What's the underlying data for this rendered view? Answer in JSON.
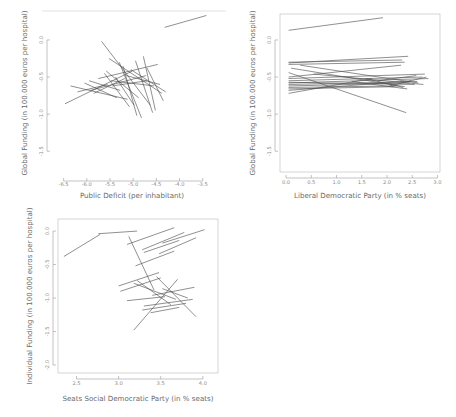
{
  "figure": {
    "title": "",
    "background": "#ffffff",
    "line_color": "#4a4a4a",
    "axis_color": "#9a9a9a",
    "panel_count": 3
  },
  "chart_data": [
    {
      "id": "panel-1",
      "type": "line",
      "title": "",
      "xlabel": "Public Deficit (per inhabitant)",
      "ylabel": "Global Funding (in 100.000 euros per hospital)",
      "xlim": [
        -6.75,
        -3.3
      ],
      "ylim": [
        -1.78,
        0.35
      ],
      "xticks": [
        -6.5,
        -6.0,
        -5.5,
        -5.0,
        -4.5,
        -4.0,
        -3.5
      ],
      "xticklabels": [
        "-6.5",
        "-6.0",
        "-5.5",
        "-5.0",
        "-4.5",
        "-4.0",
        "-3.5"
      ],
      "yticks": [
        0.0,
        -0.5,
        -1.0,
        -1.5
      ],
      "yticklabels": [
        "0.0",
        "-0.5",
        "-1.0",
        "-1.5"
      ],
      "grid": false,
      "legend": "none",
      "series": [
        {
          "name": "slope-01",
          "x": [
            -4.32,
            -3.42
          ],
          "y": [
            0.17,
            0.33
          ]
        },
        {
          "name": "slope-02",
          "x": [
            -5.68,
            -4.63
          ],
          "y": [
            -0.02,
            -0.88
          ]
        },
        {
          "name": "slope-03",
          "x": [
            -5.75,
            -4.47
          ],
          "y": [
            -0.52,
            -0.33
          ]
        },
        {
          "name": "slope-04",
          "x": [
            -5.52,
            -4.38
          ],
          "y": [
            -0.25,
            -0.72
          ]
        },
        {
          "name": "slope-05",
          "x": [
            -6.47,
            -5.02
          ],
          "y": [
            -0.86,
            -0.42
          ]
        },
        {
          "name": "slope-06",
          "x": [
            -6.35,
            -5.12
          ],
          "y": [
            -0.62,
            -0.8
          ]
        },
        {
          "name": "slope-07",
          "x": [
            -5.92,
            -4.72
          ],
          "y": [
            -0.68,
            -0.48
          ]
        },
        {
          "name": "slope-08",
          "x": [
            -5.48,
            -4.55
          ],
          "y": [
            -0.55,
            -0.62
          ]
        },
        {
          "name": "slope-09",
          "x": [
            -5.3,
            -4.82
          ],
          "y": [
            -0.3,
            -1.05
          ]
        },
        {
          "name": "slope-10",
          "x": [
            -5.22,
            -4.92
          ],
          "y": [
            -0.35,
            -1.02
          ]
        },
        {
          "name": "slope-11",
          "x": [
            -4.95,
            -4.58
          ],
          "y": [
            -0.28,
            -0.98
          ]
        },
        {
          "name": "slope-12",
          "x": [
            -5.62,
            -5.08
          ],
          "y": [
            -0.45,
            -0.9
          ]
        },
        {
          "name": "slope-13",
          "x": [
            -6.05,
            -5.35
          ],
          "y": [
            -0.58,
            -0.78
          ]
        },
        {
          "name": "slope-14",
          "x": [
            -5.05,
            -4.3
          ],
          "y": [
            -0.4,
            -0.7
          ]
        },
        {
          "name": "slope-15",
          "x": [
            -4.78,
            -4.52
          ],
          "y": [
            -0.22,
            -0.95
          ]
        },
        {
          "name": "slope-16",
          "x": [
            -5.85,
            -5.18
          ],
          "y": [
            -0.72,
            -0.52
          ]
        },
        {
          "name": "slope-17",
          "x": [
            -5.45,
            -4.7
          ],
          "y": [
            -0.62,
            -0.55
          ]
        },
        {
          "name": "slope-18",
          "x": [
            -6.2,
            -5.55
          ],
          "y": [
            -0.7,
            -0.6
          ]
        },
        {
          "name": "slope-19",
          "x": [
            -5.38,
            -4.98
          ],
          "y": [
            -0.5,
            -0.88
          ]
        },
        {
          "name": "slope-20",
          "x": [
            -5.15,
            -4.42
          ],
          "y": [
            -0.48,
            -0.6
          ]
        },
        {
          "name": "slope-21",
          "x": [
            -4.7,
            -4.35
          ],
          "y": [
            -0.38,
            -0.82
          ]
        },
        {
          "name": "slope-22",
          "x": [
            -5.95,
            -5.28
          ],
          "y": [
            -0.55,
            -0.68
          ]
        },
        {
          "name": "slope-23",
          "x": [
            -5.58,
            -4.88
          ],
          "y": [
            -0.42,
            -0.78
          ]
        }
      ]
    },
    {
      "id": "panel-2",
      "type": "line",
      "title": "",
      "xlabel": "Liberal Democratic Party (in % seats)",
      "ylabel": "Global Funding (in 100.000 euros per hospital)",
      "xlim": [
        -0.12,
        3.05
      ],
      "ylim": [
        -1.78,
        0.35
      ],
      "xticks": [
        0.0,
        0.5,
        1.0,
        1.5,
        2.0,
        2.5,
        3.0
      ],
      "xticklabels": [
        "0.0",
        "0.5",
        "1.0",
        "1.5",
        "2.0",
        "2.5",
        "3.0"
      ],
      "yticks": [
        0.0,
        -0.5,
        -1.0,
        -1.5
      ],
      "yticklabels": [
        "0.0",
        "-0.5",
        "-1.0",
        "-1.5"
      ],
      "grid": false,
      "legend": "none",
      "series": [
        {
          "name": "slope-01",
          "x": [
            0.05,
            1.92
          ],
          "y": [
            0.13,
            0.3
          ]
        },
        {
          "name": "slope-02",
          "x": [
            0.05,
            2.42
          ],
          "y": [
            -0.31,
            -0.22
          ]
        },
        {
          "name": "slope-03",
          "x": [
            0.05,
            2.35
          ],
          "y": [
            -0.33,
            -0.3
          ]
        },
        {
          "name": "slope-04",
          "x": [
            0.05,
            2.3
          ],
          "y": [
            -0.3,
            -0.27
          ]
        },
        {
          "name": "slope-05",
          "x": [
            0.05,
            2.38
          ],
          "y": [
            -0.44,
            -0.98
          ]
        },
        {
          "name": "slope-06",
          "x": [
            0.05,
            2.75
          ],
          "y": [
            -0.52,
            -0.46
          ]
        },
        {
          "name": "slope-07",
          "x": [
            0.05,
            2.7
          ],
          "y": [
            -0.55,
            -0.5
          ]
        },
        {
          "name": "slope-08",
          "x": [
            0.05,
            2.82
          ],
          "y": [
            -0.58,
            -0.52
          ]
        },
        {
          "name": "slope-09",
          "x": [
            0.05,
            2.6
          ],
          "y": [
            -0.6,
            -0.56
          ]
        },
        {
          "name": "slope-10",
          "x": [
            0.05,
            2.45
          ],
          "y": [
            -0.62,
            -0.58
          ]
        },
        {
          "name": "slope-11",
          "x": [
            0.05,
            2.55
          ],
          "y": [
            -0.57,
            -0.6
          ]
        },
        {
          "name": "slope-12",
          "x": [
            0.05,
            2.2
          ],
          "y": [
            -0.64,
            -0.62
          ]
        },
        {
          "name": "slope-13",
          "x": [
            0.05,
            2.28
          ],
          "y": [
            -0.5,
            -0.34
          ]
        },
        {
          "name": "slope-14",
          "x": [
            0.05,
            2.15
          ],
          "y": [
            -0.66,
            -0.63
          ]
        },
        {
          "name": "slope-15",
          "x": [
            0.05,
            2.48
          ],
          "y": [
            -0.68,
            -0.55
          ]
        },
        {
          "name": "slope-16",
          "x": [
            0.05,
            1.7
          ],
          "y": [
            -0.72,
            -0.52
          ]
        },
        {
          "name": "slope-17",
          "x": [
            0.1,
            2.35
          ],
          "y": [
            -0.38,
            -0.63
          ]
        },
        {
          "name": "slope-18",
          "x": [
            0.28,
            2.62
          ],
          "y": [
            -0.34,
            -0.58
          ]
        },
        {
          "name": "slope-19",
          "x": [
            0.55,
            2.72
          ],
          "y": [
            -0.46,
            -0.6
          ]
        },
        {
          "name": "slope-20",
          "x": [
            1.3,
            2.4
          ],
          "y": [
            -0.56,
            -0.66
          ]
        },
        {
          "name": "slope-21",
          "x": [
            1.58,
            2.32
          ],
          "y": [
            -0.52,
            -0.64
          ]
        },
        {
          "name": "slope-22",
          "x": [
            1.82,
            2.58
          ],
          "y": [
            -0.55,
            -0.48
          ]
        },
        {
          "name": "slope-23",
          "x": [
            2.05,
            2.78
          ],
          "y": [
            -0.62,
            -0.5
          ]
        }
      ]
    },
    {
      "id": "panel-3",
      "type": "line",
      "title": "",
      "xlabel": "Seats Social Democratic Party (in % seats)",
      "ylabel": "Individual Funding (in 100.000 euros per hospital)",
      "xlim": [
        2.28,
        4.18
      ],
      "ylim": [
        -2.12,
        0.18
      ],
      "xticks": [
        2.5,
        3.0,
        3.5,
        4.0
      ],
      "xticklabels": [
        "2.5",
        "3.0",
        "3.5",
        "4.0"
      ],
      "yticks": [
        0.0,
        -0.5,
        -1.0,
        -1.5,
        -2.0
      ],
      "yticklabels": [
        "0.0",
        "-0.5",
        "-1.0",
        "-1.5",
        "-2.0"
      ],
      "grid": false,
      "legend": "none",
      "series": [
        {
          "name": "slope-01",
          "x": [
            2.35,
            2.78
          ],
          "y": [
            -0.38,
            -0.05
          ]
        },
        {
          "name": "slope-02",
          "x": [
            2.76,
            3.22
          ],
          "y": [
            -0.04,
            0.0
          ]
        },
        {
          "name": "slope-03",
          "x": [
            3.1,
            3.66
          ],
          "y": [
            -0.2,
            0.05
          ]
        },
        {
          "name": "slope-04",
          "x": [
            3.28,
            3.78
          ],
          "y": [
            -0.28,
            -0.02
          ]
        },
        {
          "name": "slope-05",
          "x": [
            3.3,
            3.72
          ],
          "y": [
            -0.32,
            -0.14
          ]
        },
        {
          "name": "slope-06",
          "x": [
            3.52,
            4.02
          ],
          "y": [
            -0.18,
            0.02
          ]
        },
        {
          "name": "slope-07",
          "x": [
            3.48,
            3.92
          ],
          "y": [
            -0.34,
            -0.1
          ]
        },
        {
          "name": "slope-08",
          "x": [
            3.2,
            3.66
          ],
          "y": [
            -0.52,
            -0.3
          ]
        },
        {
          "name": "slope-09",
          "x": [
            3.12,
            3.42
          ],
          "y": [
            -0.08,
            -0.88
          ]
        },
        {
          "name": "slope-10",
          "x": [
            3.0,
            3.48
          ],
          "y": [
            -0.82,
            -0.62
          ]
        },
        {
          "name": "slope-11",
          "x": [
            3.02,
            3.5
          ],
          "y": [
            -0.9,
            -0.7
          ]
        },
        {
          "name": "slope-12",
          "x": [
            3.18,
            3.68
          ],
          "y": [
            -0.78,
            -1.02
          ]
        },
        {
          "name": "slope-13",
          "x": [
            3.22,
            3.62
          ],
          "y": [
            -0.74,
            -1.1
          ]
        },
        {
          "name": "slope-14",
          "x": [
            3.4,
            3.9
          ],
          "y": [
            -0.96,
            -0.84
          ]
        },
        {
          "name": "slope-15",
          "x": [
            3.1,
            3.55
          ],
          "y": [
            -1.04,
            -0.98
          ]
        },
        {
          "name": "slope-16",
          "x": [
            3.3,
            3.88
          ],
          "y": [
            -1.12,
            -1.02
          ]
        },
        {
          "name": "slope-17",
          "x": [
            3.28,
            3.8
          ],
          "y": [
            -1.18,
            -1.08
          ]
        },
        {
          "name": "slope-18",
          "x": [
            3.18,
            3.7
          ],
          "y": [
            -1.48,
            -0.72
          ]
        },
        {
          "name": "slope-19",
          "x": [
            3.45,
            3.92
          ],
          "y": [
            -0.68,
            -1.28
          ]
        },
        {
          "name": "slope-20",
          "x": [
            3.52,
            3.82
          ],
          "y": [
            -0.86,
            -1.0
          ]
        },
        {
          "name": "slope-21",
          "x": [
            3.38,
            3.72
          ],
          "y": [
            -1.22,
            -1.14
          ]
        }
      ]
    }
  ]
}
